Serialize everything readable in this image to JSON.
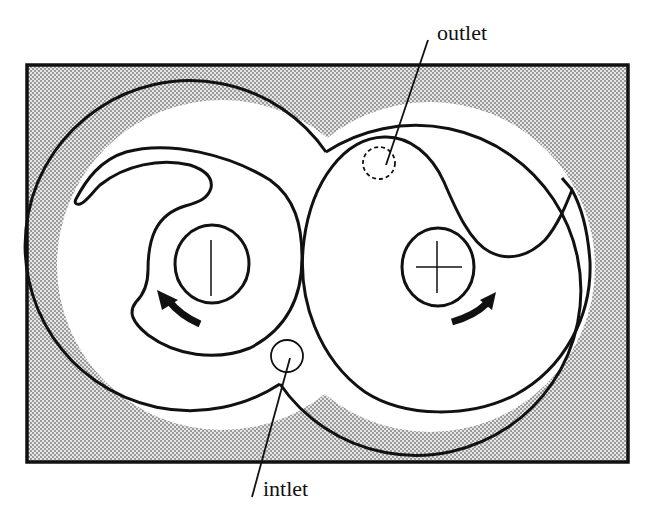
{
  "diagram": {
    "type": "rotary-compressor-cross-section",
    "labels": {
      "outlet": "outlet",
      "inlet": "intlet"
    },
    "colors": {
      "stroke": "#111111",
      "background": "#ffffff",
      "casing_fill": "#c9c9c9",
      "stipple_dot": "#7a7a7a"
    },
    "components": {
      "housing_frame": "rectangular housing with stippled fill",
      "left_casing_bore": "left circular casing bore",
      "right_casing_bore": "right circular casing bore",
      "left_rotor": "left rotor with hooked lobe, shaft marked with vertical line",
      "right_rotor": "right rotor with wavy lobe, shaft marked with cross",
      "left_rotation_arrow": "counter-clockwise rotation arrow",
      "right_rotation_arrow": "clockwise rotation arrow",
      "inlet_port": "solid-outline circular port near bottom cusp",
      "outlet_port": "dashed-outline circular port near top of right rotor"
    }
  }
}
